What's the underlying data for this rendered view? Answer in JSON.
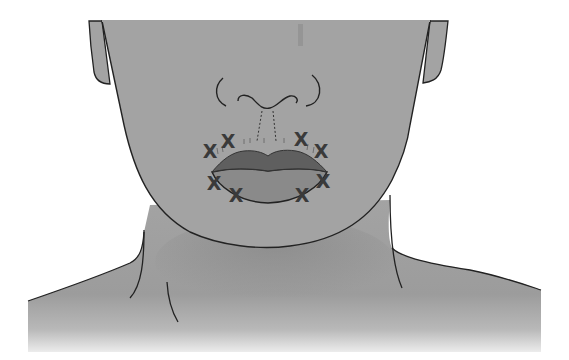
{
  "figure": {
    "colors": {
      "skin": "#a3a3a3",
      "skin_shadow": "#8f8f8f",
      "upper_lip": "#5f5f5f",
      "lower_lip": "#8a8a8a",
      "outline": "#222222",
      "marker": "#3a3a3a",
      "background": "#ffffff"
    },
    "marker_glyph": "X",
    "injection_points": [
      {
        "id": "upper-left-outer",
        "x": 210,
        "y": 151
      },
      {
        "id": "upper-left-inner",
        "x": 228,
        "y": 141
      },
      {
        "id": "upper-right-inner",
        "x": 301,
        "y": 139
      },
      {
        "id": "upper-right-outer",
        "x": 321,
        "y": 151
      },
      {
        "id": "lower-left-outer",
        "x": 214,
        "y": 183
      },
      {
        "id": "lower-left-inner",
        "x": 236,
        "y": 195
      },
      {
        "id": "lower-right-inner",
        "x": 302,
        "y": 195
      },
      {
        "id": "lower-right-outer",
        "x": 323,
        "y": 181
      }
    ],
    "labels": {
      "philtrum": "dotted philtrum column lines",
      "vermilion": "short hatch marks along upper lip border"
    }
  }
}
